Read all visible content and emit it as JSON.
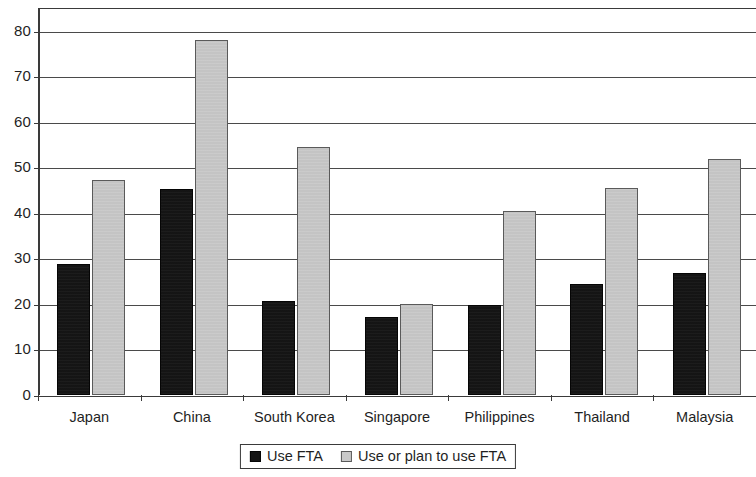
{
  "chart_data": {
    "type": "bar",
    "title": "",
    "subtitle": "",
    "xlabel": "",
    "ylabel": "",
    "categories": [
      "Japan",
      "China",
      "South Korea",
      "Singapore",
      "Philippines",
      "Thailand",
      "Malaysia"
    ],
    "series": [
      {
        "name": "Use FTA",
        "color": "#151515",
        "values": [
          28.8,
          45.2,
          20.6,
          17.1,
          19.8,
          24.3,
          26.8
        ]
      },
      {
        "name": "Use or plan to use FTA",
        "color": "#c9c9c9",
        "values": [
          47.3,
          78.0,
          54.4,
          19.9,
          40.5,
          45.5,
          51.8
        ]
      }
    ],
    "ylim": [
      0,
      85
    ],
    "yticks": [
      0,
      10,
      20,
      30,
      40,
      50,
      60,
      70,
      80
    ],
    "ytick_labels": [
      "0",
      "10",
      "20",
      "30",
      "40",
      "50",
      "60",
      "70",
      "80"
    ],
    "grid": true,
    "grid_axis": "y",
    "legend_position": "bottom-center"
  },
  "legend": {
    "entries": [
      {
        "label": "Use FTA",
        "swatch": "dark-square-swatch"
      },
      {
        "label": "Use or plan to use FTA",
        "swatch": "light-square-swatch"
      }
    ]
  },
  "axes": {
    "y_max_rendered": 85,
    "y_axis_line_color": "#3a3a3a",
    "gridline_color": "#4a4a4a"
  }
}
